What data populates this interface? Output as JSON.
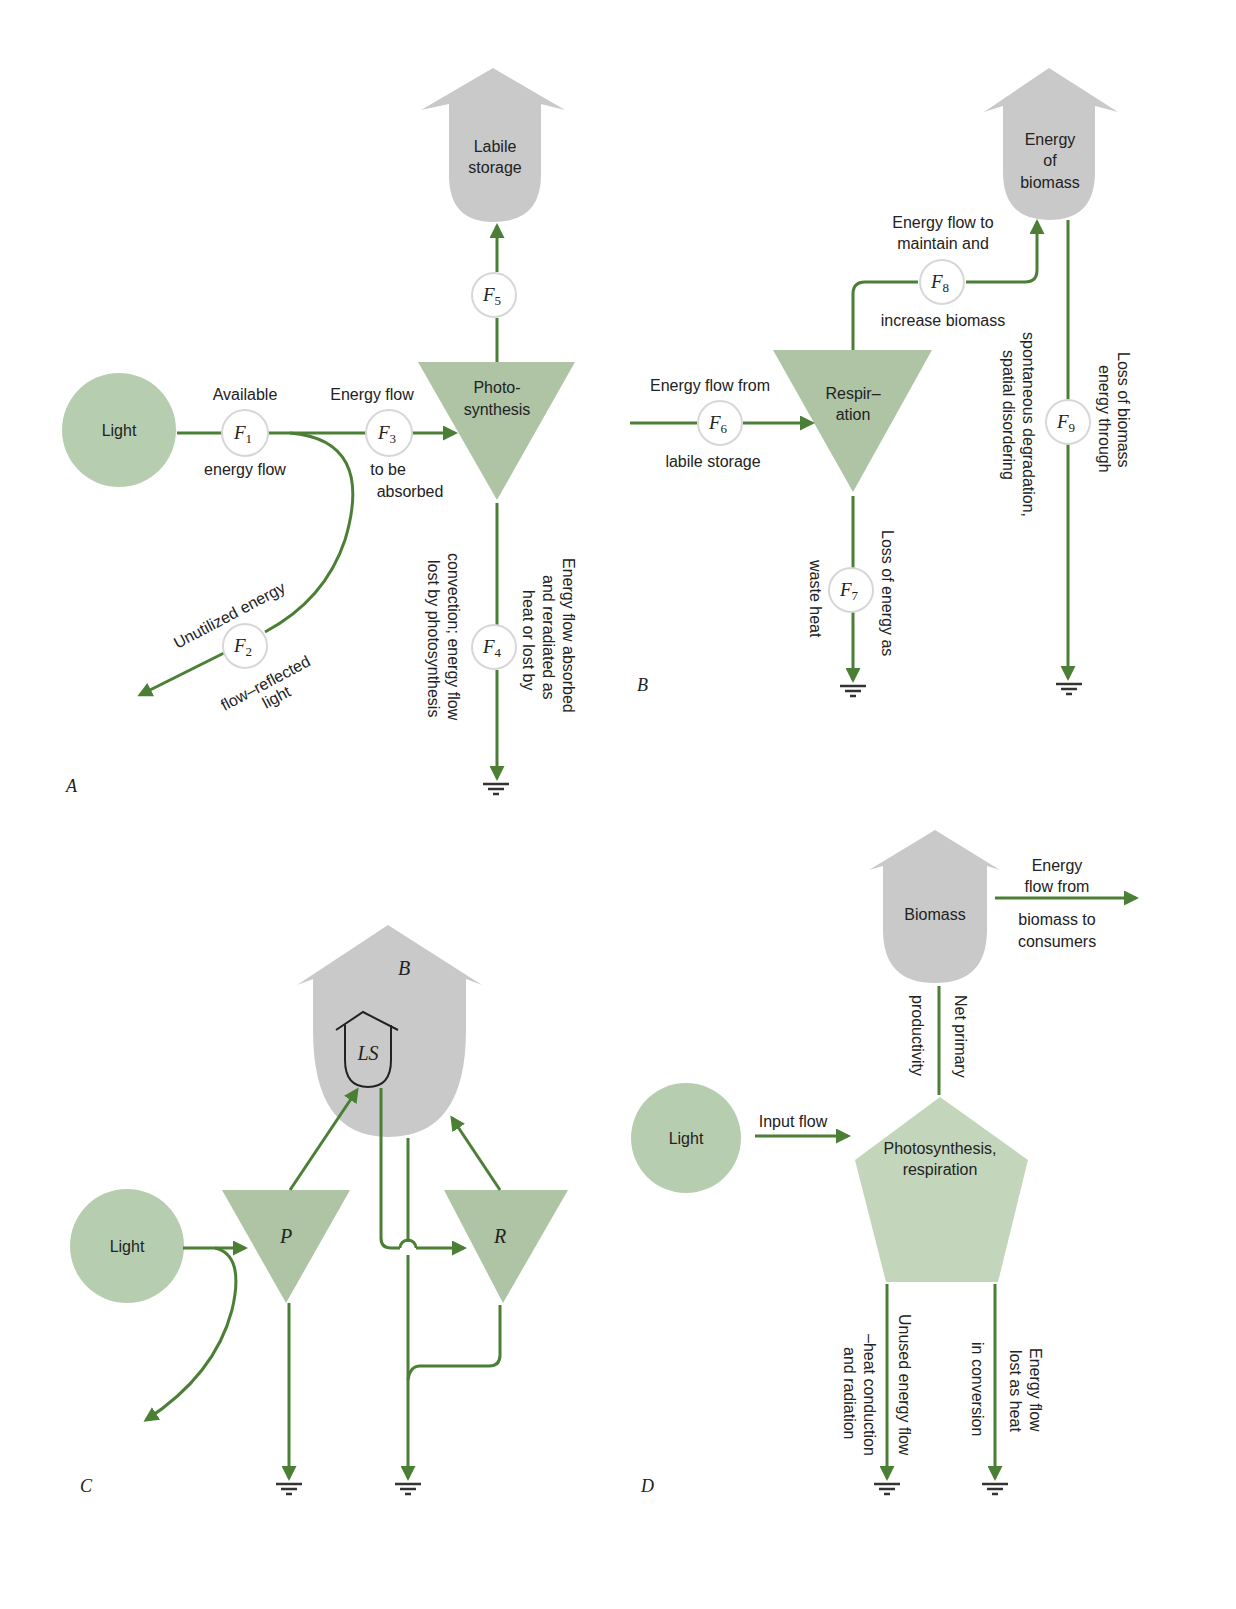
{
  "panels": {
    "A": {
      "label": "A",
      "source": "Light",
      "storage": [
        "Labile",
        "storage"
      ],
      "process": [
        "Photo-",
        "synthesis"
      ],
      "flows": {
        "F1": {
          "sym": "F",
          "sub": "1",
          "above": "Available",
          "below": "energy flow"
        },
        "F2": {
          "sym": "F",
          "sub": "2",
          "above": "Unutilized energy",
          "below1": "flow–reflected",
          "below2": "light"
        },
        "F3": {
          "sym": "F",
          "sub": "3",
          "above": "Energy flow",
          "below1": "to be",
          "below2": "absorbed"
        },
        "F4": {
          "sym": "F",
          "sub": "4",
          "text_right": [
            "Energy flow absorbed",
            "and reradiated as",
            "heat or lost by"
          ],
          "text_left": [
            "convection; energy flow",
            "lost by photosynthesis"
          ]
        },
        "F5": {
          "sym": "F",
          "sub": "5"
        }
      }
    },
    "B": {
      "label": "B",
      "storage": [
        "Energy",
        "of",
        "biomass"
      ],
      "process": [
        "Respir–",
        "ation"
      ],
      "flows": {
        "F6": {
          "sym": "F",
          "sub": "6",
          "above": "Energy flow from",
          "below": "labile storage"
        },
        "F7": {
          "sym": "F",
          "sub": "7",
          "text_right": "Loss of energy as",
          "text_left": "waste heat"
        },
        "F8": {
          "sym": "F",
          "sub": "8",
          "above1": "Energy flow to",
          "above2": "maintain and",
          "below": "increase biomass"
        },
        "F9": {
          "sym": "F",
          "sub": "9",
          "text_right": [
            "Loss of biomass",
            "energy through"
          ],
          "text_left": [
            "spontaneous degradation,",
            "spatial disordering"
          ]
        }
      }
    },
    "C": {
      "label": "C",
      "source": "Light",
      "storage_outer": "B",
      "storage_inner": "LS",
      "process_p": "P",
      "process_r": "R"
    },
    "D": {
      "label": "D",
      "source": "Light",
      "storage": "Biomass",
      "process": [
        "Photosynthesis,",
        "respiration"
      ],
      "input_flow": "Input flow",
      "consumer_flow": [
        "Energy",
        "flow from",
        "biomass to",
        "consumers"
      ],
      "npp": [
        "Net primary",
        "productivity"
      ],
      "unused": [
        "Unused energy flow",
        "–heat conduction",
        "and radiation"
      ],
      "heat_loss": [
        "Energy flow",
        "lost as heat",
        "in conversion"
      ]
    }
  },
  "colors": {
    "flow_line": "#4b7f35",
    "storage_fill": "#c9c9c9",
    "source_fill": "#b7cdb0",
    "process_fill": "#aec4a5"
  }
}
